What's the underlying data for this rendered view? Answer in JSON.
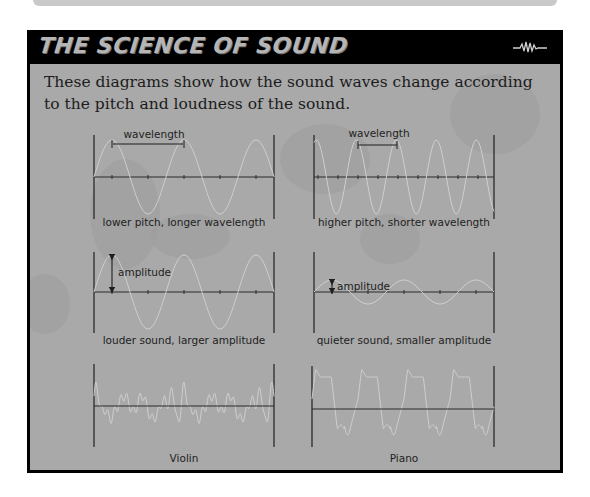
{
  "header": {
    "title": "THE SCIENCE OF SOUND",
    "icon": "sound-wave-icon"
  },
  "intro": "These diagrams show how the sound waves change according to the pitch and loudness of the sound.",
  "colors": {
    "panel_border": "#000000",
    "panel_bg": "#a9a9a9",
    "title_text": "#b5b5b5",
    "axis": "#2a2a2a",
    "wave": "#c8c8c8"
  },
  "diagrams": [
    {
      "id": "lower-pitch",
      "caption": "lower pitch, longer wavelength",
      "annotation": "wavelength",
      "type": "sine",
      "period_px": 72,
      "amplitude_px": 37
    },
    {
      "id": "higher-pitch",
      "caption": "higher pitch, shorter wavelength",
      "annotation": "wavelength",
      "type": "sine",
      "period_px": 40,
      "amplitude_px": 37
    },
    {
      "id": "louder-sound",
      "caption": "louder sound, larger amplitude",
      "annotation": "amplitude",
      "type": "sine",
      "period_px": 72,
      "amplitude_px": 37
    },
    {
      "id": "quieter-sound",
      "caption": "quieter sound, smaller amplitude",
      "annotation": "amplitude",
      "type": "sine",
      "period_px": 72,
      "amplitude_px": 12
    },
    {
      "id": "violin",
      "caption": "Violin",
      "annotation": "",
      "type": "complex",
      "period_px": 44
    },
    {
      "id": "piano",
      "caption": "Piano",
      "annotation": "",
      "type": "square-ish",
      "period_px": 46
    }
  ]
}
